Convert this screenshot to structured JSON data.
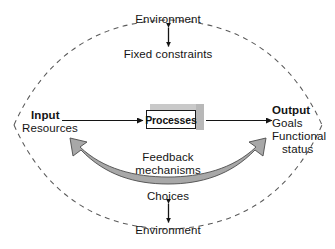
{
  "diagram": {
    "background": "#ffffff",
    "ink": "#141414",
    "feedback_arrow_fill": "#a8a8a8",
    "box_top_fill": "#c9c9c9",
    "box_side_fill": "#b8b8b8"
  },
  "boundary": {
    "shape": "lens",
    "style": "dashed",
    "left_vertex_x": 14,
    "right_vertex_x": 322,
    "vertex_y": 125,
    "top_apex_y": 20,
    "bottom_apex_y": 229
  },
  "top": {
    "environment_label": "Environment",
    "constraints_label": "Fixed constraints",
    "connector": "double-headed-vertical-arrow"
  },
  "bottom": {
    "choices_label": "Choices",
    "environment_label": "Environment",
    "connector": "double-headed-vertical-arrow"
  },
  "flow": {
    "input_title": "Input",
    "input_items": [
      "Resources"
    ],
    "process_label": "Processes",
    "output_title": "Output",
    "output_items": [
      "Goals",
      "Functional",
      "status"
    ],
    "input_arrow": "arrow-right",
    "output_arrow": "arrow-right"
  },
  "feedback": {
    "label_line1": "Feedback",
    "label_line2": "mechanisms",
    "arrow": "curved-double-headed-arrow"
  }
}
